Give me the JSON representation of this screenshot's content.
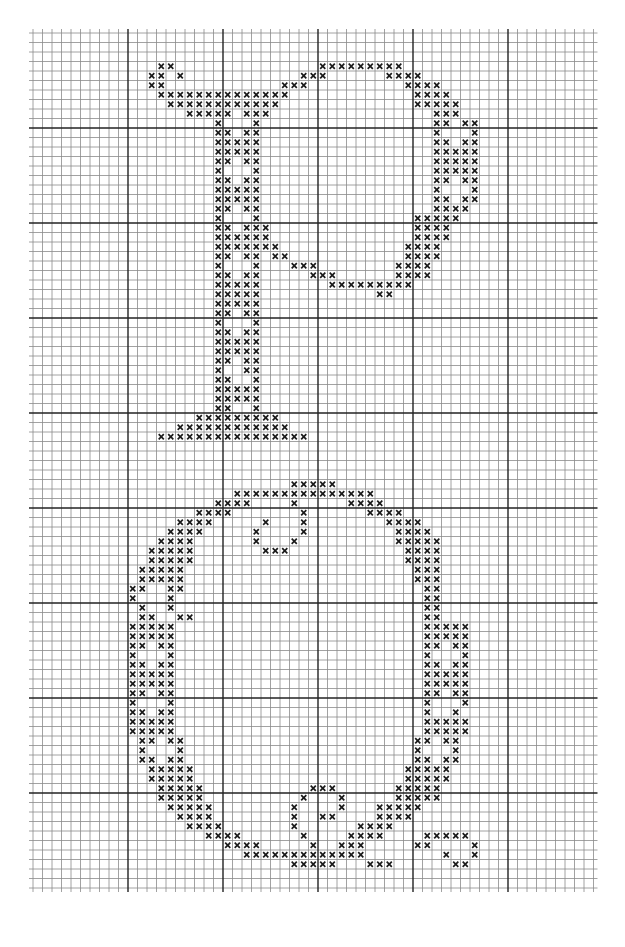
{
  "chart_data": {
    "type": "cross-stitch-pattern",
    "title": "",
    "letters": [
      "P",
      "Q"
    ],
    "grid": {
      "origin_x": 33,
      "origin_y": 33,
      "cell": 9.5,
      "cols": 59,
      "rows": 90,
      "major_every": 10,
      "line_color": "#8a8a8a",
      "major_line_color": "#222222",
      "stitch_color": "#1a1a1a"
    },
    "stitch_symbol": "x",
    "stitches": {
      "P": [
        [
          3,
          13,
          14
        ],
        [
          3,
          30,
          38
        ],
        [
          4,
          12,
          13
        ],
        [
          4,
          15,
          15
        ],
        [
          4,
          28,
          30
        ],
        [
          4,
          37,
          40
        ],
        [
          5,
          12,
          13
        ],
        [
          5,
          26,
          28
        ],
        [
          5,
          39,
          42
        ],
        [
          6,
          13,
          26
        ],
        [
          6,
          40,
          43
        ],
        [
          7,
          14,
          25
        ],
        [
          7,
          40,
          44
        ],
        [
          8,
          16,
          20
        ],
        [
          8,
          22,
          24
        ],
        [
          8,
          42,
          44
        ],
        [
          9,
          19,
          19
        ],
        [
          9,
          23,
          23
        ],
        [
          9,
          42,
          43
        ],
        [
          9,
          45,
          46
        ],
        [
          10,
          19,
          20
        ],
        [
          10,
          22,
          23
        ],
        [
          10,
          42,
          42
        ],
        [
          10,
          46,
          46
        ],
        [
          11,
          19,
          23
        ],
        [
          11,
          42,
          43
        ],
        [
          11,
          45,
          46
        ],
        [
          12,
          19,
          23
        ],
        [
          12,
          42,
          46
        ],
        [
          13,
          19,
          20
        ],
        [
          13,
          22,
          23
        ],
        [
          13,
          42,
          46
        ],
        [
          14,
          19,
          19
        ],
        [
          14,
          23,
          23
        ],
        [
          14,
          42,
          46
        ],
        [
          15,
          19,
          20
        ],
        [
          15,
          22,
          23
        ],
        [
          15,
          42,
          43
        ],
        [
          15,
          45,
          46
        ],
        [
          16,
          19,
          23
        ],
        [
          16,
          42,
          42
        ],
        [
          16,
          46,
          46
        ],
        [
          17,
          19,
          23
        ],
        [
          17,
          42,
          43
        ],
        [
          17,
          45,
          46
        ],
        [
          18,
          19,
          20
        ],
        [
          18,
          22,
          23
        ],
        [
          18,
          42,
          45
        ],
        [
          19,
          19,
          19
        ],
        [
          19,
          23,
          23
        ],
        [
          19,
          40,
          44
        ],
        [
          20,
          19,
          20
        ],
        [
          20,
          22,
          24
        ],
        [
          20,
          40,
          43
        ],
        [
          21,
          19,
          24
        ],
        [
          21,
          40,
          43
        ],
        [
          22,
          19,
          25
        ],
        [
          22,
          39,
          42
        ],
        [
          23,
          19,
          20
        ],
        [
          23,
          22,
          23
        ],
        [
          23,
          25,
          26
        ],
        [
          23,
          39,
          42
        ],
        [
          24,
          19,
          19
        ],
        [
          24,
          23,
          23
        ],
        [
          24,
          27,
          29
        ],
        [
          24,
          38,
          41
        ],
        [
          25,
          19,
          20
        ],
        [
          25,
          22,
          23
        ],
        [
          25,
          29,
          31
        ],
        [
          25,
          38,
          41
        ],
        [
          26,
          19,
          23
        ],
        [
          26,
          31,
          39
        ],
        [
          27,
          19,
          23
        ],
        [
          27,
          36,
          37
        ],
        [
          28,
          19,
          23
        ],
        [
          29,
          19,
          20
        ],
        [
          29,
          22,
          23
        ],
        [
          30,
          19,
          19
        ],
        [
          30,
          23,
          23
        ],
        [
          31,
          19,
          20
        ],
        [
          31,
          22,
          23
        ],
        [
          32,
          19,
          23
        ],
        [
          33,
          19,
          23
        ],
        [
          34,
          19,
          20
        ],
        [
          34,
          22,
          23
        ],
        [
          35,
          19,
          19
        ],
        [
          35,
          22,
          23
        ],
        [
          36,
          19,
          20
        ],
        [
          36,
          23,
          23
        ],
        [
          37,
          19,
          23
        ],
        [
          38,
          19,
          23
        ],
        [
          39,
          19,
          20
        ],
        [
          39,
          23,
          23
        ],
        [
          40,
          17,
          25
        ],
        [
          41,
          15,
          26
        ],
        [
          42,
          13,
          28
        ]
      ],
      "Q": [
        [
          47,
          27,
          31
        ],
        [
          48,
          21,
          31
        ],
        [
          48,
          32,
          35
        ],
        [
          49,
          19,
          22
        ],
        [
          49,
          27,
          27
        ],
        [
          49,
          33,
          36
        ],
        [
          50,
          17,
          20
        ],
        [
          50,
          28,
          28
        ],
        [
          50,
          35,
          38
        ],
        [
          51,
          15,
          18
        ],
        [
          51,
          24,
          24
        ],
        [
          51,
          28,
          28
        ],
        [
          51,
          37,
          40
        ],
        [
          52,
          14,
          17
        ],
        [
          52,
          23,
          23
        ],
        [
          52,
          28,
          28
        ],
        [
          52,
          38,
          41
        ],
        [
          53,
          13,
          16
        ],
        [
          53,
          23,
          23
        ],
        [
          53,
          27,
          27
        ],
        [
          53,
          38,
          42
        ],
        [
          54,
          12,
          16
        ],
        [
          54,
          24,
          26
        ],
        [
          54,
          39,
          42
        ],
        [
          55,
          12,
          16
        ],
        [
          55,
          39,
          42
        ],
        [
          56,
          11,
          15
        ],
        [
          56,
          40,
          42
        ],
        [
          57,
          11,
          15
        ],
        [
          57,
          40,
          42
        ],
        [
          58,
          10,
          11
        ],
        [
          58,
          14,
          15
        ],
        [
          58,
          41,
          42
        ],
        [
          59,
          10,
          10
        ],
        [
          59,
          14,
          14
        ],
        [
          59,
          41,
          42
        ],
        [
          60,
          11,
          11
        ],
        [
          60,
          14,
          14
        ],
        [
          60,
          41,
          42
        ],
        [
          61,
          11,
          12
        ],
        [
          61,
          15,
          16
        ],
        [
          61,
          41,
          42
        ],
        [
          62,
          10,
          14
        ],
        [
          62,
          41,
          45
        ],
        [
          63,
          10,
          14
        ],
        [
          63,
          41,
          45
        ],
        [
          64,
          10,
          11
        ],
        [
          64,
          13,
          14
        ],
        [
          64,
          41,
          42
        ],
        [
          64,
          44,
          45
        ],
        [
          65,
          10,
          10
        ],
        [
          65,
          14,
          14
        ],
        [
          65,
          41,
          41
        ],
        [
          65,
          45,
          45
        ],
        [
          66,
          10,
          11
        ],
        [
          66,
          13,
          14
        ],
        [
          66,
          41,
          42
        ],
        [
          66,
          44,
          45
        ],
        [
          67,
          10,
          14
        ],
        [
          67,
          41,
          45
        ],
        [
          68,
          10,
          14
        ],
        [
          68,
          41,
          45
        ],
        [
          69,
          10,
          11
        ],
        [
          69,
          13,
          14
        ],
        [
          69,
          41,
          42
        ],
        [
          69,
          44,
          45
        ],
        [
          70,
          10,
          10
        ],
        [
          70,
          14,
          14
        ],
        [
          70,
          41,
          41
        ],
        [
          70,
          45,
          45
        ],
        [
          71,
          10,
          11
        ],
        [
          71,
          13,
          14
        ],
        [
          71,
          41,
          41
        ],
        [
          71,
          44,
          44
        ],
        [
          72,
          10,
          14
        ],
        [
          72,
          41,
          45
        ],
        [
          73,
          10,
          14
        ],
        [
          73,
          41,
          45
        ],
        [
          74,
          11,
          12
        ],
        [
          74,
          14,
          15
        ],
        [
          74,
          40,
          41
        ],
        [
          74,
          43,
          44
        ],
        [
          75,
          11,
          11
        ],
        [
          75,
          15,
          15
        ],
        [
          75,
          40,
          40
        ],
        [
          75,
          44,
          44
        ],
        [
          76,
          11,
          12
        ],
        [
          76,
          14,
          15
        ],
        [
          76,
          40,
          41
        ],
        [
          76,
          43,
          44
        ],
        [
          77,
          12,
          16
        ],
        [
          77,
          39,
          43
        ],
        [
          78,
          12,
          16
        ],
        [
          78,
          39,
          43
        ],
        [
          79,
          13,
          17
        ],
        [
          79,
          38,
          42
        ],
        [
          79,
          29,
          31
        ],
        [
          80,
          13,
          17
        ],
        [
          80,
          38,
          42
        ],
        [
          80,
          28,
          28
        ],
        [
          80,
          32,
          32
        ],
        [
          81,
          14,
          18
        ],
        [
          81,
          36,
          40
        ],
        [
          81,
          27,
          27
        ],
        [
          81,
          32,
          32
        ],
        [
          82,
          15,
          18
        ],
        [
          82,
          36,
          39
        ],
        [
          82,
          27,
          27
        ],
        [
          82,
          30,
          31
        ],
        [
          83,
          16,
          19
        ],
        [
          83,
          34,
          37
        ],
        [
          83,
          27,
          27
        ],
        [
          84,
          18,
          21
        ],
        [
          84,
          33,
          36
        ],
        [
          84,
          28,
          28
        ],
        [
          84,
          41,
          45
        ],
        [
          85,
          20,
          23
        ],
        [
          85,
          32,
          34
        ],
        [
          85,
          29,
          29
        ],
        [
          85,
          40,
          41
        ],
        [
          85,
          46,
          46
        ],
        [
          86,
          22,
          34
        ],
        [
          86,
          43,
          43
        ],
        [
          86,
          46,
          46
        ],
        [
          87,
          27,
          31
        ],
        [
          87,
          35,
          37
        ],
        [
          87,
          44,
          45
        ]
      ]
    }
  }
}
